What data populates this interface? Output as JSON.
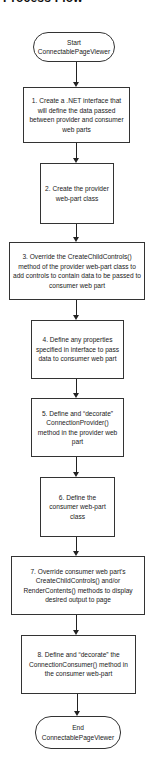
{
  "diagram": {
    "title": "Process Flow",
    "start": {
      "label": "Start ConnectablePageViewer"
    },
    "steps": [
      {
        "label": "1. Create a .NET interface that will define the data passed between provider and consumer web parts"
      },
      {
        "label": "2. Create the provider web-part class"
      },
      {
        "label": "3. Override the CreateChildControls() method of the provider web-part class to add controls to contain data to be passed to consumer web part"
      },
      {
        "label": "4. Define any properties specified in interface to pass data to consumer web part"
      },
      {
        "label": "5. Define and “decorate” ConnectionProvider() method in the provider web part"
      },
      {
        "label": "6. Define the consumer web-part class"
      },
      {
        "label": "7. Override consumer web part's CreateChildControls() and/or RenderContents() methods to display desired output to page"
      },
      {
        "label": "8. Define and “decorate” the ConnectionConsumer() method in the consumer web-part"
      }
    ],
    "end": {
      "label": "End ConnectablePageViewer"
    },
    "colors": {
      "stroke": "#333333",
      "fill": "#ffffff",
      "text": "#1a1a1a"
    }
  }
}
